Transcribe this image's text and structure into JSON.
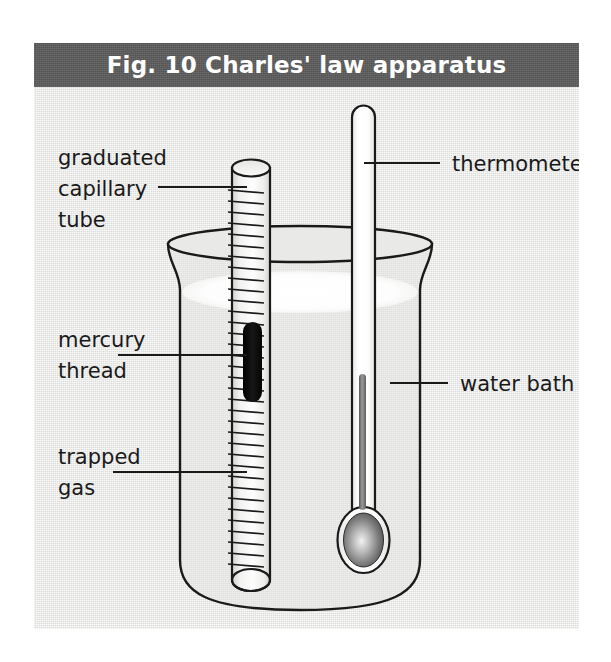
{
  "figure": {
    "title": "Fig. 10 Charles' law apparatus",
    "title_bar_color": "#5c5c5c",
    "panel_color": "#e8e8e6",
    "ink_color": "#1a1a1a"
  },
  "labels": {
    "graduated_capillary_tube": {
      "line1": "graduated",
      "line2": "capillary",
      "line3": "tube"
    },
    "mercury_thread": {
      "line1": "mercury",
      "line2": "thread"
    },
    "trapped_gas": {
      "line1": "trapped",
      "line2": "gas"
    },
    "thermometer": "thermometer",
    "water_bath": "water bath"
  },
  "apparatus": {
    "beaker": "water bath beaker",
    "capillary_tube": "graduated capillary tube",
    "mercury_thread": "mercury thread",
    "thermometer": "thermometer",
    "water_surface": "water surface",
    "mercury_color": "#111111",
    "water_surface_color": "#fbfbfb",
    "thermometer_fluid_color": "#8a8a8a"
  }
}
